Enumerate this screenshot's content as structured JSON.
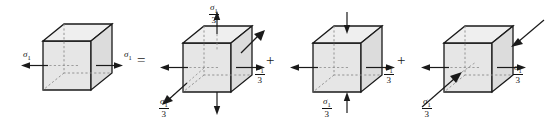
{
  "figure": {
    "type": "engineering-stress-decomposition-diagram",
    "operators": [
      {
        "name": "equals",
        "symbol": "=",
        "x": 137,
        "y": 53
      },
      {
        "name": "plus-1",
        "symbol": "+",
        "x": 266,
        "y": 53
      },
      {
        "name": "plus-2",
        "symbol": "+",
        "x": 397,
        "y": 53
      }
    ],
    "panels": [
      {
        "id": "panel-1",
        "name": "uniaxial-stress-cube",
        "x": 20,
        "labels": [
          {
            "name": "sigma1-left",
            "sigma": "σ",
            "sub": "1",
            "fraction": false,
            "x": 3,
            "y": 50,
            "align": "left"
          },
          {
            "name": "sigma1-right",
            "sigma": "σ",
            "sub": "1",
            "fraction": false,
            "x": 104,
            "y": 50,
            "align": "left"
          }
        ]
      },
      {
        "id": "panel-2",
        "name": "hydrostatic-stress-cube",
        "x": 150,
        "labels": [
          {
            "name": "sigma1-over-3-top",
            "sigma": "σ",
            "sub": "1",
            "fraction": true,
            "den": "3",
            "x": 59,
            "y": 2,
            "align": "left"
          },
          {
            "name": "sigma1-over-3-right",
            "sigma": "σ",
            "sub": "1",
            "fraction": true,
            "den": "3",
            "x": 105,
            "y": 62,
            "align": "left"
          },
          {
            "name": "sigma1-over-3-bottom-left",
            "sigma": "σ",
            "sub": "1",
            "fraction": true,
            "den": "3",
            "x": 9,
            "y": 96,
            "align": "left"
          }
        ]
      },
      {
        "id": "panel-3",
        "name": "deviatoric-stress-cube-vertical",
        "x": 283,
        "labels": [
          {
            "name": "sigma1-over-3-right",
            "sigma": "σ",
            "sub": "1",
            "fraction": true,
            "den": "3",
            "x": 101,
            "y": 62,
            "align": "left"
          },
          {
            "name": "sigma1-over-3-bottom",
            "sigma": "σ",
            "sub": "1",
            "fraction": true,
            "den": "3",
            "x": 39,
            "y": 96,
            "align": "left"
          }
        ]
      },
      {
        "id": "panel-4",
        "name": "deviatoric-stress-cube-depth",
        "x": 414,
        "labels": [
          {
            "name": "sigma1-over-3-right",
            "sigma": "σ",
            "sub": "1",
            "fraction": true,
            "den": "3",
            "x": 99,
            "y": 62,
            "align": "left"
          },
          {
            "name": "sigma1-over-3-bottom-left",
            "sigma": "σ",
            "sub": "1",
            "fraction": true,
            "den": "3",
            "x": 8,
            "y": 96,
            "align": "left"
          }
        ]
      }
    ],
    "colors": {
      "face_front": "#e6e6e6",
      "face_top": "#efefef",
      "face_side": "#dcdcdc",
      "edge": "#1a1a1a",
      "hidden_edge": "#7a7a7a",
      "arrow": "#1a1a1a",
      "background": "#ffffff"
    }
  }
}
